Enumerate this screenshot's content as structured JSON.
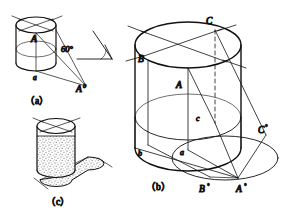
{
  "figure": {
    "background_color": "#ffffff",
    "line_color": "#111111",
    "stipple_color": "#555555"
  },
  "light_angle": {
    "value": "60°",
    "name": "light-ray-angle"
  },
  "panels": [
    {
      "id": "a",
      "caption": "（a）",
      "labels": [
        {
          "key": "A",
          "text": "A",
          "sup": ""
        },
        {
          "key": "a",
          "text": "a",
          "sup": ""
        },
        {
          "key": "A0",
          "text": "A",
          "sup": "0"
        }
      ]
    },
    {
      "id": "b",
      "caption": "（b）",
      "labels": [
        {
          "key": "A",
          "text": "A",
          "sup": ""
        },
        {
          "key": "B",
          "text": "B",
          "sup": ""
        },
        {
          "key": "C",
          "text": "C",
          "sup": ""
        },
        {
          "key": "a",
          "text": "a",
          "sup": ""
        },
        {
          "key": "b",
          "text": "b",
          "sup": ""
        },
        {
          "key": "c",
          "text": "c",
          "sup": ""
        },
        {
          "key": "A0",
          "text": "A",
          "sup": "°"
        },
        {
          "key": "B0",
          "text": "B",
          "sup": "°"
        },
        {
          "key": "C0",
          "text": "C",
          "sup": "°"
        }
      ]
    },
    {
      "id": "c",
      "caption": "（c）",
      "labels": []
    }
  ],
  "captions": {
    "a": "（a）",
    "b": "（b）",
    "c": "（c）"
  },
  "label_text": {
    "A_upper": "A",
    "B_upper": "B",
    "C_upper": "C",
    "a_lower": "a",
    "b_lower": "b",
    "c_lower": "c",
    "A_base": "A",
    "B_base": "B",
    "C_base": "C",
    "deg_sup": "°",
    "zero_sup": "0"
  },
  "panel_a": {
    "A_label": "A",
    "a_label": "a",
    "A0_base": "A",
    "A0_sup": "0"
  },
  "panel_b": {
    "A_label": "A",
    "B_label": "B",
    "C_label": "C",
    "a_label": "a",
    "b_label": "b",
    "c_label": "c",
    "A0_base": "A",
    "A0_sup": "°",
    "B0_base": "B",
    "B0_sup": "°",
    "C0_base": "C",
    "C0_sup": "°"
  }
}
